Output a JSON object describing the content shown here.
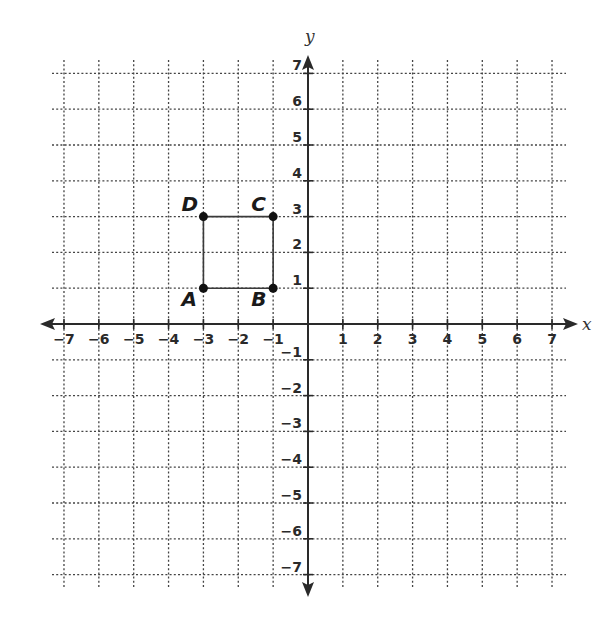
{
  "chart_data": {
    "type": "scatter",
    "title": "",
    "xlabel": "x",
    "ylabel": "y",
    "xlim": [
      -7,
      7
    ],
    "ylim": [
      -7,
      7
    ],
    "grid": true,
    "x_ticks": [
      -7,
      -6,
      -5,
      -4,
      -3,
      -2,
      -1,
      1,
      2,
      3,
      4,
      5,
      6,
      7
    ],
    "y_ticks": [
      -7,
      -6,
      -5,
      -4,
      -3,
      -2,
      -1,
      1,
      2,
      3,
      4,
      5,
      6,
      7
    ],
    "x_tick_labels": [
      "−7",
      "−6",
      "−5",
      "−4",
      "−3",
      "−2",
      "−1",
      "1",
      "2",
      "3",
      "4",
      "5",
      "6",
      "7"
    ],
    "y_tick_labels": [
      "−7",
      "−6",
      "−5",
      "−4",
      "−3",
      "−2",
      "−1",
      "1",
      "2",
      "3",
      "4",
      "5",
      "6",
      "7"
    ],
    "points": [
      {
        "label": "A",
        "x": -3,
        "y": 1
      },
      {
        "label": "B",
        "x": -1,
        "y": 1
      },
      {
        "label": "C",
        "x": -1,
        "y": 3
      },
      {
        "label": "D",
        "x": -3,
        "y": 3
      }
    ],
    "polygon": {
      "name": "ABCD",
      "vertices": [
        "A",
        "B",
        "C",
        "D"
      ],
      "closed": true
    }
  },
  "labels": {
    "x_axis": "x",
    "y_axis": "y"
  }
}
